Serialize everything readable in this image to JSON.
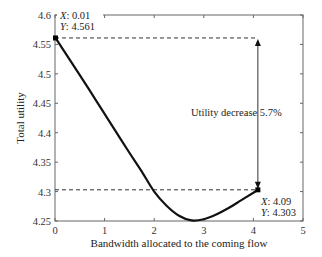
{
  "chart_data": {
    "type": "line",
    "title": "",
    "xlabel": "Bandwidth allocated to the coming flow",
    "ylabel": "Total utility",
    "xlim": [
      0,
      5
    ],
    "ylim": [
      4.25,
      4.6
    ],
    "xticks": [
      0,
      1,
      2,
      3,
      4,
      5
    ],
    "xtick_labels": [
      "0",
      "1",
      "2",
      "3",
      "4",
      "5"
    ],
    "yticks": [
      4.25,
      4.3,
      4.35,
      4.4,
      4.45,
      4.5,
      4.55,
      4.6
    ],
    "ytick_labels": [
      "4.25",
      "4.3",
      "4.35",
      "4.4",
      "4.45",
      "4.5",
      "4.55",
      "4.6"
    ],
    "grid": false,
    "legend": null,
    "series": [
      {
        "name": "Total utility",
        "color": "#111111",
        "x": [
          0.01,
          0.25,
          0.5,
          0.75,
          1.0,
          1.25,
          1.5,
          1.75,
          2.0,
          2.25,
          2.5,
          2.75,
          3.0,
          3.25,
          3.5,
          3.75,
          4.0,
          4.09
        ],
        "y": [
          4.561,
          4.53,
          4.498,
          4.465,
          4.432,
          4.399,
          4.366,
          4.334,
          4.3,
          4.276,
          4.259,
          4.251,
          4.253,
          4.261,
          4.272,
          4.285,
          4.298,
          4.303
        ]
      }
    ],
    "annotations": [
      {
        "type": "datatip",
        "x": 0.01,
        "y": 4.561,
        "text_x": "X: 0.01",
        "text_y": "Y: 4.561"
      },
      {
        "type": "datatip",
        "x": 4.09,
        "y": 4.303,
        "text_x": "X: 4.09",
        "text_y": "Y: 4.303"
      },
      {
        "type": "hline-dashed",
        "y": 4.561,
        "x_from": 0,
        "x_to": 4.09
      },
      {
        "type": "hline-dashed",
        "y": 4.303,
        "x_from": 0,
        "x_to": 4.09
      },
      {
        "type": "double-arrow",
        "x": 4.09,
        "y_from": 4.561,
        "y_to": 4.303
      },
      {
        "type": "text",
        "text": "Utility decrease 5.7%",
        "x": 3.25,
        "y": 4.43
      }
    ]
  },
  "labels": {
    "xlabel": "Bandwidth allocated to the coming flow",
    "ylabel": "Total utility",
    "tip1_x": "X: 0.01",
    "tip1_y": "Y: 4.561",
    "tip2_x": "X: 4.09",
    "tip2_y": "Y: 4.303",
    "decrease": "Utility decrease 5.7%"
  }
}
